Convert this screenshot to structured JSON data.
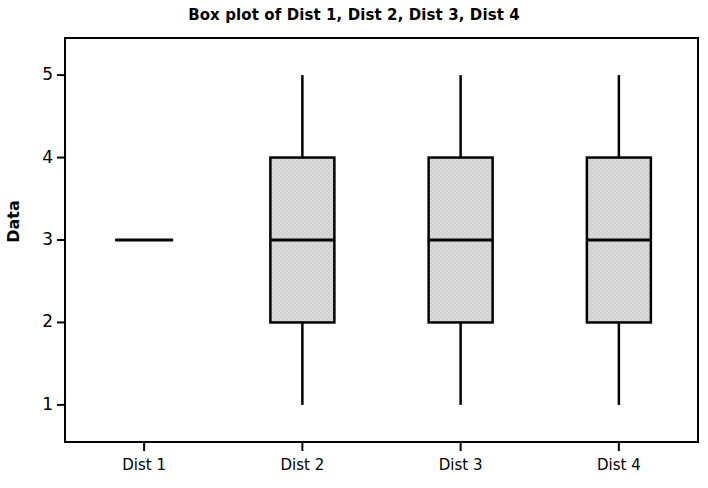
{
  "chart_data": {
    "type": "box",
    "title": "Box plot of Dist 1, Dist 2, Dist 3, Dist 4",
    "xlabel": "",
    "ylabel": "Data",
    "categories": [
      "Dist 1",
      "Dist 2",
      "Dist 3",
      "Dist 4"
    ],
    "ylim": [
      0.55,
      5.45
    ],
    "yticks": [
      1,
      2,
      3,
      4,
      5
    ],
    "ytick_labels": [
      "1",
      "2",
      "3",
      "4",
      "5"
    ],
    "grid": false,
    "legend": false,
    "boxes": [
      {
        "label": "Dist 1",
        "whisker_low": 3,
        "q1": 3,
        "median": 3,
        "q3": 3,
        "whisker_high": 3,
        "degenerate": true
      },
      {
        "label": "Dist 2",
        "whisker_low": 1,
        "q1": 2,
        "median": 3,
        "q3": 4,
        "whisker_high": 5,
        "degenerate": false
      },
      {
        "label": "Dist 3",
        "whisker_low": 1,
        "q1": 2,
        "median": 3,
        "q3": 4,
        "whisker_high": 5,
        "degenerate": false
      },
      {
        "label": "Dist 4",
        "whisker_low": 1,
        "q1": 2,
        "median": 3,
        "q3": 4,
        "whisker_high": 5,
        "degenerate": false
      }
    ]
  },
  "style": {
    "box_fill": "#d9d9d9",
    "line_color": "#000000",
    "frame_color": "#000000",
    "background": "#ffffff"
  }
}
